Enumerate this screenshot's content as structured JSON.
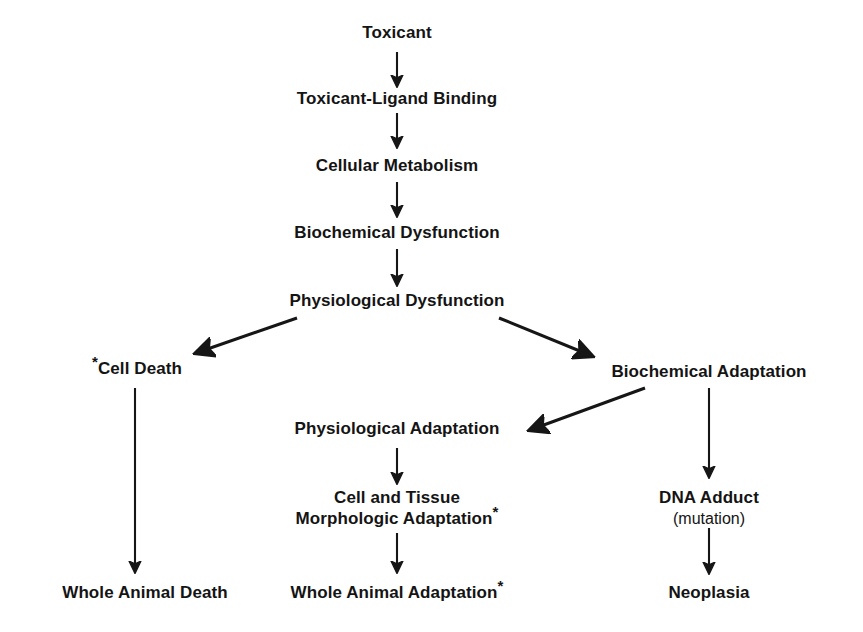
{
  "diagram": {
    "background_color": "#ffffff",
    "line_color": "#161616",
    "text_color": "#141414",
    "nodes": [
      {
        "id": "toxicant",
        "label": "Toxicant"
      },
      {
        "id": "toxicant-ligand-binding",
        "label": "Toxicant-Ligand Binding"
      },
      {
        "id": "cellular-metabolism",
        "label": "Cellular Metabolism"
      },
      {
        "id": "biochemical-dysfunction",
        "label": "Biochemical Dysfunction"
      },
      {
        "id": "physiological-dysfunction",
        "label": "Physiological Dysfunction"
      },
      {
        "id": "cell-death",
        "label": "Cell Death",
        "leading_marker": "*"
      },
      {
        "id": "biochemical-adaptation",
        "label": "Biochemical Adaptation"
      },
      {
        "id": "physiological-adaptation",
        "label": "Physiological Adaptation"
      },
      {
        "id": "cell-tissue-morphologic-adaptation",
        "line1": "Cell and Tissue",
        "line2": "Morphologic Adaptation",
        "trailing_marker": "*"
      },
      {
        "id": "dna-adduct",
        "line1": "DNA Adduct",
        "line2": "(mutation)"
      },
      {
        "id": "whole-animal-death",
        "label": "Whole Animal Death"
      },
      {
        "id": "whole-animal-adaptation",
        "label": "Whole Animal Adaptation",
        "trailing_marker": "*"
      },
      {
        "id": "neoplasia",
        "label": "Neoplasia"
      }
    ]
  }
}
